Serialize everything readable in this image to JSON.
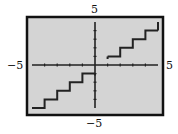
{
  "chart_data": {
    "type": "line",
    "title": "",
    "xlabel": "",
    "ylabel": "",
    "xlim": [
      -5,
      5
    ],
    "ylim": [
      -5,
      5
    ],
    "grid": false,
    "legend": null,
    "tick_labels": {
      "x_min": "−5",
      "x_max": "5",
      "y_min": "−5",
      "y_max": "5"
    },
    "xticks": [
      -4,
      -3,
      -2,
      -1,
      1,
      2,
      3,
      4
    ],
    "yticks": [
      -4,
      -3,
      -2,
      -1,
      1,
      2,
      3,
      4
    ],
    "function_guess": "f(x) ≈ floor(x), best visual fit; not confirmed",
    "series": [
      {
        "name": "step",
        "drawn_segments": [
          {
            "x": [
              -5,
              -4
            ],
            "y": -5
          },
          {
            "x": [
              -4,
              -3
            ],
            "y": -4
          },
          {
            "x": [
              -3,
              -2
            ],
            "y": -3
          },
          {
            "x": [
              -2,
              -1
            ],
            "y": -2
          },
          {
            "x": [
              -1,
              0
            ],
            "y": -1
          },
          {
            "x": [
              1,
              2
            ],
            "y": 1
          },
          {
            "x": [
              2,
              3
            ],
            "y": 2
          },
          {
            "x": [
              3,
              4
            ],
            "y": 3
          },
          {
            "x": [
              4,
              5
            ],
            "y": 4
          }
        ],
        "observed_features": [
          "short vertical stroke near x=0 running from y=-1 downward toward the x-axis",
          "small rise at the start of the right-hand branch near x=1, just below y=1",
          "vertical rise at the right edge near x=5 to about y=5",
          "segment for [0,1) at y=0, if present, coincides with the x-axis and cannot be seen"
        ]
      }
    ]
  },
  "colors": {
    "plot_background": "#d4d4d4",
    "frame": "#111111",
    "axes": "#222222",
    "curve": "#222222"
  }
}
